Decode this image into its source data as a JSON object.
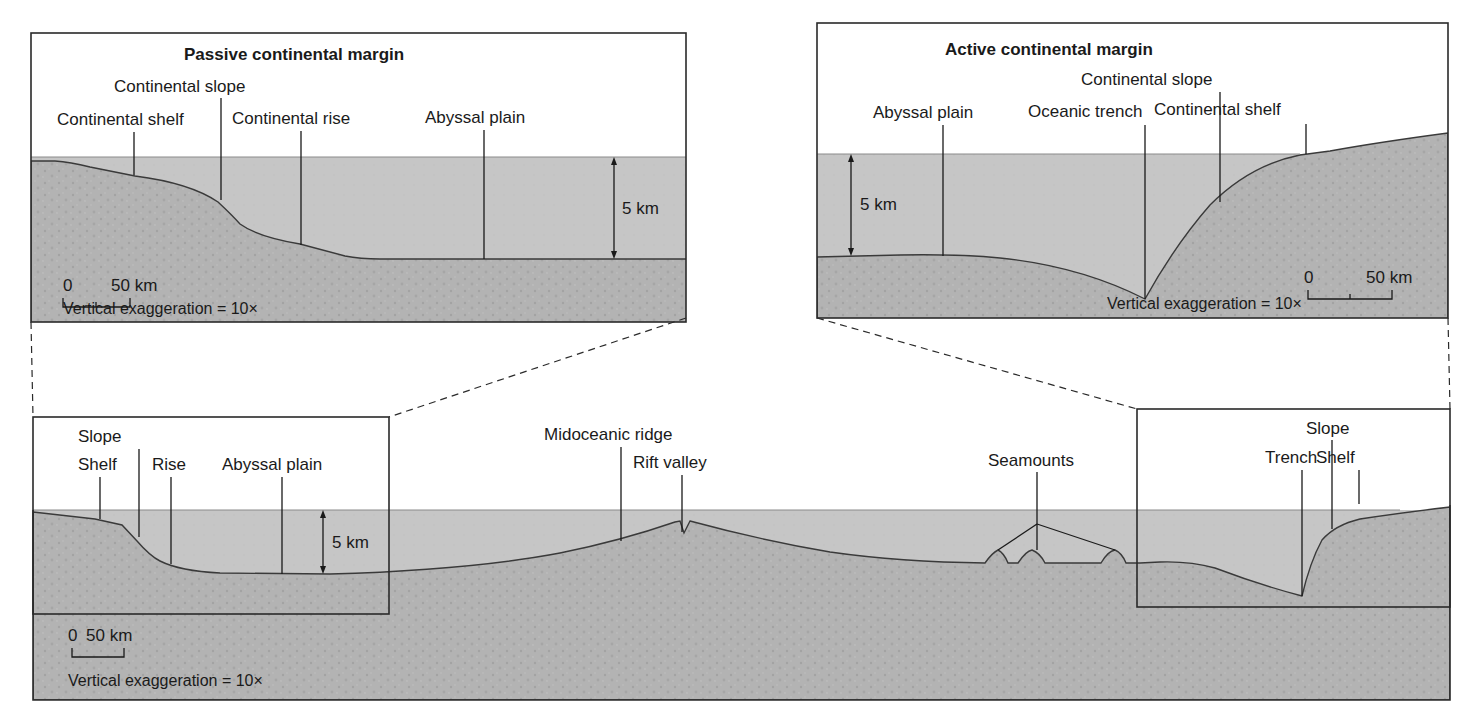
{
  "figure": {
    "colors": {
      "background": "#ffffff",
      "water": "#c4c4c4",
      "rock": "#b3b3b3",
      "rock_speckle": "#a4a4a4",
      "line": "#1a1a1a"
    }
  },
  "passive_margin": {
    "title": "Passive continental margin",
    "labels": {
      "continental_slope": "Continental slope",
      "continental_shelf": "Continental shelf",
      "continental_rise": "Continental rise",
      "abyssal_plain": "Abyssal plain"
    },
    "depth_scale": "5 km",
    "scale_bar": {
      "start": "0",
      "end": "50 km"
    },
    "vertical_exaggeration": "Vertical exaggeration = 10×"
  },
  "active_margin": {
    "title": "Active continental margin",
    "labels": {
      "abyssal_plain": "Abyssal plain",
      "oceanic_trench": "Oceanic trench",
      "continental_slope": "Continental slope",
      "continental_shelf": "Continental shelf"
    },
    "depth_scale": "5 km",
    "scale_bar": {
      "start": "0",
      "end": "50 km"
    },
    "vertical_exaggeration": "Vertical exaggeration = 10×"
  },
  "ocean_basin": {
    "labels": {
      "slope": "Slope",
      "shelf": "Shelf",
      "rise": "Rise",
      "abyssal_plain": "Abyssal plain",
      "midoceanic_ridge": "Midoceanic ridge",
      "rift_valley": "Rift valley",
      "seamounts": "Seamounts",
      "trench": "Trench",
      "slope_right": "Slope",
      "shelf_right": "Shelf"
    },
    "depth_scale": "5 km",
    "scale_bar": {
      "start": "0",
      "end": "50 km"
    },
    "vertical_exaggeration": "Vertical exaggeration = 10×"
  }
}
